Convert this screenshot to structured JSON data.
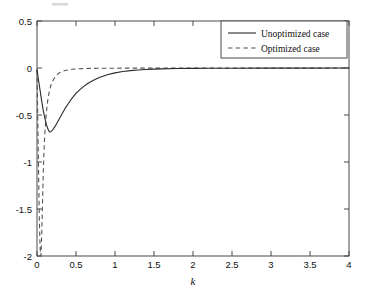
{
  "chart_data": {
    "type": "line",
    "title": "",
    "subtitle": "",
    "xlabel": "k",
    "ylabel": "",
    "xlim": [
      0,
      4
    ],
    "ylim": [
      -2,
      0.5
    ],
    "grid": false,
    "legend_position": "top-right",
    "xticks": [
      0,
      0.5,
      1,
      1.5,
      2,
      2.5,
      3,
      3.5,
      4
    ],
    "xtick_labels": [
      "0",
      "0.5",
      "1",
      "1.5",
      "2",
      "2.5",
      "3",
      "3.5",
      "4"
    ],
    "yticks": [
      0.5,
      0,
      -0.5,
      -1,
      -1.5,
      -2
    ],
    "ytick_labels": [
      "0.5",
      "0",
      "-0.5",
      "-1",
      "-1.5",
      "-2"
    ],
    "series": [
      {
        "name": "Unoptimized case",
        "style": "solid",
        "color": "#2b2b2b",
        "x": [
          0.0,
          0.02,
          0.04,
          0.06,
          0.08,
          0.1,
          0.12,
          0.14,
          0.16,
          0.18,
          0.2,
          0.24,
          0.28,
          0.32,
          0.36,
          0.4,
          0.45,
          0.5,
          0.55,
          0.6,
          0.65,
          0.7,
          0.75,
          0.8,
          0.9,
          1.0,
          1.1,
          1.2,
          1.3,
          1.4,
          1.5,
          1.6,
          1.8,
          2.0,
          2.2,
          2.5,
          3.0,
          3.5,
          4.0
        ],
        "y": [
          -0.02,
          -0.13,
          -0.24,
          -0.35,
          -0.45,
          -0.53,
          -0.6,
          -0.65,
          -0.68,
          -0.675,
          -0.66,
          -0.61,
          -0.55,
          -0.49,
          -0.43,
          -0.38,
          -0.32,
          -0.27,
          -0.23,
          -0.195,
          -0.165,
          -0.14,
          -0.12,
          -0.1,
          -0.072,
          -0.052,
          -0.038,
          -0.028,
          -0.021,
          -0.016,
          -0.012,
          -0.009,
          -0.006,
          -0.004,
          -0.003,
          -0.002,
          -0.001,
          -0.001,
          0.0
        ]
      },
      {
        "name": "Optimized case",
        "style": "dashed",
        "color": "#555555",
        "x": [
          0.0,
          0.01,
          0.02,
          0.03,
          0.04,
          0.05,
          0.06,
          0.07,
          0.08,
          0.09,
          0.1,
          0.12,
          0.14,
          0.16,
          0.18,
          0.2,
          0.24,
          0.28,
          0.32,
          0.36,
          0.4,
          0.45,
          0.5,
          0.6,
          0.7,
          0.8,
          0.9,
          1.0,
          1.2,
          1.5,
          2.0,
          2.5,
          3.0,
          3.5,
          4.0
        ],
        "y": [
          -0.02,
          -0.55,
          -1.1,
          -1.6,
          -1.92,
          -2.0,
          -1.8,
          -1.45,
          -1.12,
          -0.88,
          -0.7,
          -0.47,
          -0.33,
          -0.24,
          -0.18,
          -0.14,
          -0.085,
          -0.055,
          -0.038,
          -0.027,
          -0.02,
          -0.014,
          -0.01,
          -0.006,
          -0.004,
          -0.003,
          -0.002,
          -0.002,
          -0.001,
          -0.001,
          0.0,
          0.0,
          0.0,
          0.0,
          0.0
        ]
      }
    ],
    "annotations": []
  },
  "legend": {
    "entries": [
      {
        "label": "Unoptimized case",
        "style": "solid"
      },
      {
        "label": "Optimized case",
        "style": "dashed"
      }
    ]
  },
  "axes": {
    "x_title": "k"
  }
}
